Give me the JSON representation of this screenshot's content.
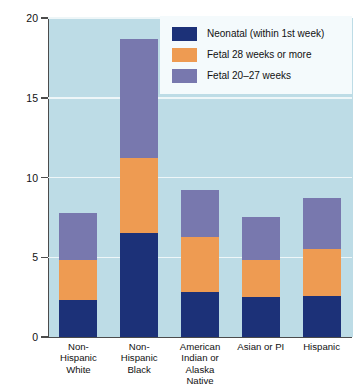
{
  "chart_data": {
    "type": "bar",
    "title": "",
    "subtitle": "",
    "xlabel": "",
    "ylabel": "Rate per 1000 live births and fetal deaths",
    "ylim": [
      0,
      20
    ],
    "yticks": [
      "0",
      "5",
      "10",
      "15",
      "20"
    ],
    "ytick_values": [
      0,
      5,
      10,
      15,
      20
    ],
    "grid": true,
    "stacked": true,
    "legend_position": "top-right",
    "categories": [
      "Non-Hispanic White",
      "Non-Hispanic Black",
      "American Indian or Alaska Native",
      "Asian or PI",
      "Hispanic"
    ],
    "category_label_lines": [
      [
        "Non-",
        "Hispanic",
        "White"
      ],
      [
        "Non-",
        "Hispanic",
        "Black"
      ],
      [
        "American",
        "Indian or",
        "Alaska",
        "Native"
      ],
      [
        "Asian or PI"
      ],
      [
        "Hispanic"
      ]
    ],
    "series": [
      {
        "name": "Neonatal (within 1st week)",
        "color": "#1c3178",
        "values": [
          2.3,
          6.5,
          2.8,
          2.5,
          2.6
        ]
      },
      {
        "name": "Fetal 28 weeks or more",
        "color": "#ee9b52",
        "values": [
          2.5,
          4.7,
          3.5,
          2.3,
          2.9
        ]
      },
      {
        "name": "Fetal 20–27 weeks",
        "color": "#7878ae",
        "values": [
          3.0,
          7.5,
          2.9,
          2.7,
          3.2
        ]
      }
    ],
    "totals": [
      7.8,
      18.7,
      9.2,
      7.5,
      8.7
    ],
    "colors": {
      "plot_background": "#bddce6",
      "gridline": "#eef6f8",
      "axis": "#4c4c4c",
      "legend_background": "#f4fafc",
      "page_background": "#ffffff"
    }
  },
  "legend": {
    "items": [
      {
        "label": "Neonatal (within 1st week)",
        "color": "#1c3178"
      },
      {
        "label": "Fetal 28 weeks or more",
        "color": "#ee9b52"
      },
      {
        "label": "Fetal 20–27 weeks",
        "color": "#7878ae"
      }
    ]
  }
}
